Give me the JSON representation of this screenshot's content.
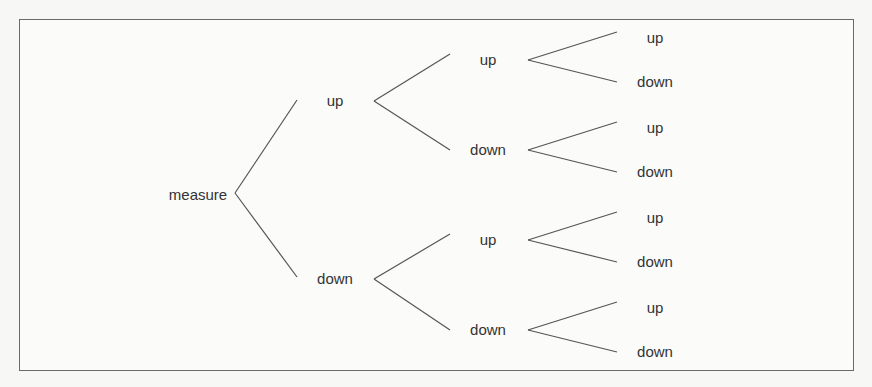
{
  "diagram": {
    "type": "tree",
    "title": "",
    "root": {
      "label": "measure",
      "children": [
        {
          "label": "up",
          "children": [
            {
              "label": "up",
              "children": [
                {
                  "label": "up"
                },
                {
                  "label": "down"
                }
              ]
            },
            {
              "label": "down",
              "children": [
                {
                  "label": "up"
                },
                {
                  "label": "down"
                }
              ]
            }
          ]
        },
        {
          "label": "down",
          "children": [
            {
              "label": "up",
              "children": [
                {
                  "label": "up"
                },
                {
                  "label": "down"
                }
              ]
            },
            {
              "label": "down",
              "children": [
                {
                  "label": "up"
                },
                {
                  "label": "down"
                }
              ]
            }
          ]
        }
      ]
    }
  }
}
